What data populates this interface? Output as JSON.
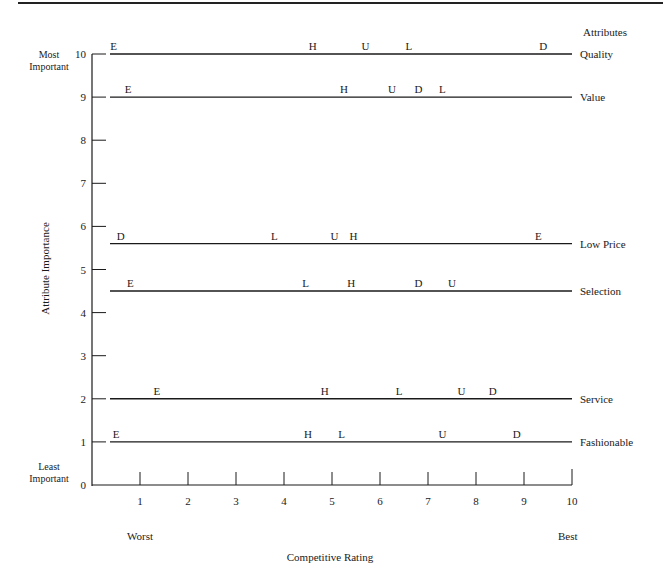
{
  "chart_data": {
    "type": "scatter",
    "title": "",
    "xlabel": "Competitive Rating",
    "ylabel": "Attribute Importance",
    "xlim": [
      0,
      10
    ],
    "ylim": [
      0,
      10
    ],
    "x_ticks": [
      1,
      2,
      3,
      4,
      5,
      6,
      7,
      8,
      9,
      10
    ],
    "y_ticks": [
      0,
      1,
      2,
      3,
      4,
      5,
      6,
      7,
      8,
      9,
      10
    ],
    "x_end_labels": {
      "low": "Worst",
      "high": "Best"
    },
    "y_end_labels": {
      "high": "Most Important",
      "low": "Least Important"
    },
    "attributes_header": "Attributes",
    "grid": false,
    "series": [
      {
        "attribute": "Quality",
        "importance": 10,
        "points": [
          {
            "label": "E",
            "x": 0.45
          },
          {
            "label": "H",
            "x": 4.6
          },
          {
            "label": "U",
            "x": 5.7
          },
          {
            "label": "L",
            "x": 6.6
          },
          {
            "label": "D",
            "x": 9.4
          }
        ]
      },
      {
        "attribute": "Value",
        "importance": 9,
        "points": [
          {
            "label": "E",
            "x": 0.75
          },
          {
            "label": "H",
            "x": 5.25
          },
          {
            "label": "U",
            "x": 6.25
          },
          {
            "label": "D",
            "x": 6.8
          },
          {
            "label": "L",
            "x": 7.3
          }
        ]
      },
      {
        "attribute": "Low Price",
        "importance": 5.6,
        "points": [
          {
            "label": "D",
            "x": 0.6
          },
          {
            "label": "L",
            "x": 3.8
          },
          {
            "label": "U",
            "x": 5.05
          },
          {
            "label": "H",
            "x": 5.45
          },
          {
            "label": "E",
            "x": 9.3
          }
        ]
      },
      {
        "attribute": "Selection",
        "importance": 4.5,
        "points": [
          {
            "label": "E",
            "x": 0.8
          },
          {
            "label": "L",
            "x": 4.45
          },
          {
            "label": "H",
            "x": 5.4
          },
          {
            "label": "D",
            "x": 6.8
          },
          {
            "label": "U",
            "x": 7.5
          }
        ]
      },
      {
        "attribute": "Service",
        "importance": 2,
        "points": [
          {
            "label": "E",
            "x": 1.35
          },
          {
            "label": "H",
            "x": 4.85
          },
          {
            "label": "L",
            "x": 6.4
          },
          {
            "label": "U",
            "x": 7.7
          },
          {
            "label": "D",
            "x": 8.35
          }
        ]
      },
      {
        "attribute": "Fashionable",
        "importance": 1,
        "points": [
          {
            "label": "E",
            "x": 0.5
          },
          {
            "label": "H",
            "x": 4.5
          },
          {
            "label": "L",
            "x": 5.2
          },
          {
            "label": "U",
            "x": 7.3
          },
          {
            "label": "D",
            "x": 8.85
          }
        ]
      }
    ]
  },
  "labels": {
    "attributes_header": "Attributes",
    "most_important": "Most Important",
    "least_important": "Least Important",
    "y_axis_title": "Attribute Importance",
    "x_axis_title": "Competitive Rating",
    "worst": "Worst",
    "best": "Best"
  },
  "layout": {
    "x0_px": 92,
    "x10_px": 572,
    "y0_px": 485,
    "y10_px": 54,
    "line_start_px": 110,
    "line_end_px": 572,
    "ink_color": "#1a1a1a"
  }
}
